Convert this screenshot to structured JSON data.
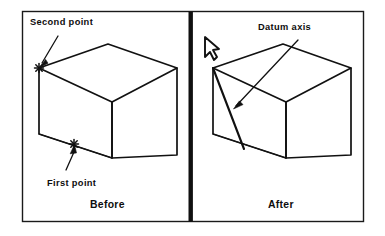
{
  "figure": {
    "background_color": "#ffffff",
    "line_color": "#111111",
    "divider_color": "#101010"
  },
  "panels": [
    {
      "id": "before",
      "caption": "Before",
      "callouts": [
        {
          "name": "second-point",
          "label": "Second point"
        },
        {
          "name": "first-point",
          "label": "First point"
        }
      ]
    },
    {
      "id": "after",
      "caption": "After",
      "callouts": [
        {
          "name": "datum-axis",
          "label": "Datum axis"
        }
      ],
      "cursor": {
        "name": "arrow-cursor",
        "label": "pointer"
      }
    }
  ],
  "geometry": {
    "frame": {
      "x": 22,
      "y": 11,
      "width": 342,
      "height": 211
    },
    "divider_x": 191,
    "before_box": {
      "top_left": [
        39,
        68
      ],
      "top_back": [
        108,
        44
      ],
      "top_right": [
        177,
        68
      ],
      "mid_front": [
        112,
        102
      ],
      "bottom_left": [
        41,
        134
      ],
      "bottom_front": [
        112,
        158
      ],
      "bottom_right": [
        177,
        155
      ]
    },
    "after_box": {
      "top_left": [
        213,
        68
      ],
      "top_back": [
        283,
        44
      ],
      "top_right": [
        351,
        68
      ],
      "mid_front": [
        286,
        102
      ],
      "bottom_left": [
        214,
        134
      ],
      "bottom_front": [
        286,
        158
      ],
      "bottom_right": [
        351,
        155
      ]
    },
    "datum_axis": {
      "from": [
        213,
        68
      ],
      "to": [
        244,
        149
      ]
    },
    "markers": {
      "second_point": [
        39,
        68
      ],
      "first_point": [
        74,
        144
      ]
    }
  },
  "labels": {
    "second_point": "Second point",
    "first_point": "First point",
    "datum_axis": "Datum axis",
    "before": "Before",
    "after": "After"
  }
}
